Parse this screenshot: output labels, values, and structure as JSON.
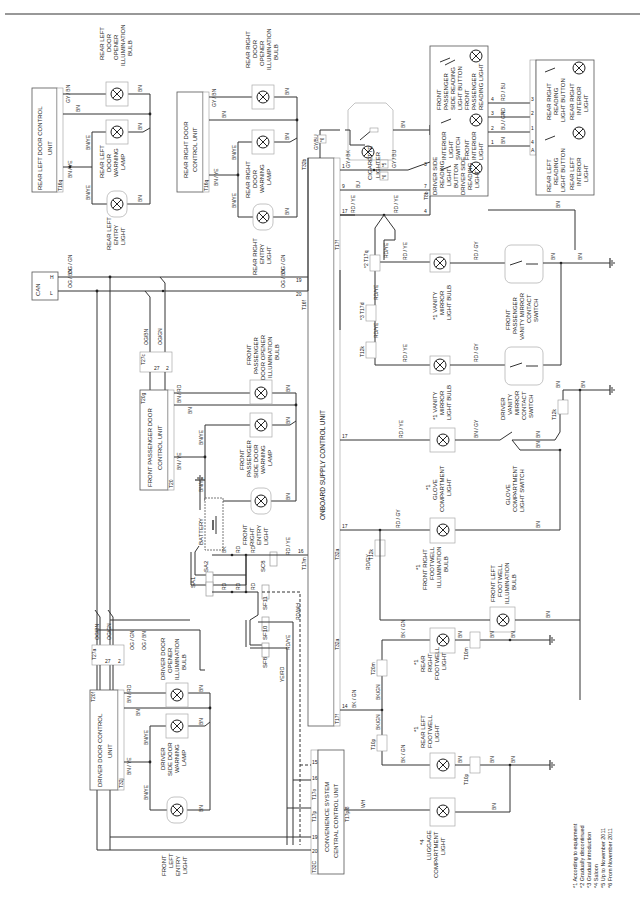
{
  "diagram": {
    "orientation": "rotated-90-ccw",
    "title_hint": "Interior lighting wiring diagram",
    "control_units": [
      {
        "id": "rear_left_door_cu",
        "label_l1": "REAR LEFT DOOR CONTROL",
        "label_l2": "UNIT",
        "connector": "T16q",
        "pins": [
          "1",
          "13",
          "12"
        ]
      },
      {
        "id": "rear_right_door_cu",
        "label_l1": "REAR RIGHT DOOR",
        "label_l2": "CONTROL UNIT",
        "connector": "T16q",
        "pins": [
          "1",
          "13",
          "12"
        ]
      },
      {
        "id": "front_passenger_door_cu",
        "label_l1": "FRONT PASSENGER DOOR",
        "label_l2": "CONTROL UNIT",
        "connector_a": "T20g",
        "connector_b": "T20",
        "pins": [
          "14",
          "15",
          "3",
          "5",
          "16"
        ]
      },
      {
        "id": "driver_door_cu",
        "label_l1": "DRIVER DOOR CONTROL",
        "label_l2": "UNIT",
        "connector_a": "T20f",
        "connector_b": "T32j",
        "pins": [
          "14",
          "15",
          "3",
          "5",
          "16"
        ]
      },
      {
        "id": "onboard_supply_cu",
        "label": "ONBOARD SUPPLY CONTROL UNIT",
        "connectors": [
          "T32b",
          "T17f",
          "T32a",
          "T17m",
          "T16f"
        ],
        "pins": [
          "17",
          "1",
          "9",
          "17",
          "17",
          "14",
          "16",
          "20",
          "19"
        ]
      },
      {
        "id": "convenience_cu",
        "label_l1": "CONVENIENCE SYSTEM",
        "label_l2": "CENTRAL CONTROL UNIT",
        "connectors": [
          "T32C",
          "T17p",
          "T17o",
          "T17p/8"
        ],
        "pins": [
          "20",
          "19",
          "16",
          "16",
          "15",
          "8"
        ]
      },
      {
        "id": "front_interior_light_unit",
        "connector": "T8b",
        "pins": [
          "3",
          "7",
          "4",
          "5",
          "1",
          "2",
          "3",
          "4"
        ]
      },
      {
        "id": "rear_interior_light_unit",
        "connector": "A",
        "pins": [
          "4",
          "1",
          "2",
          "3"
        ]
      }
    ],
    "components": {
      "rear_left_door_opener": [
        "REAR LEFT",
        "DOOR",
        "OPENER",
        "ILLUMINATION",
        "BULB"
      ],
      "rear_left_door_warning": [
        "REAR LEFT",
        "DOOR",
        "WARNING",
        "LAMP"
      ],
      "rear_left_entry": [
        "REAR LEFT",
        "ENTRY",
        "LIGHT"
      ],
      "rear_right_door_opener": [
        "REAR RIGHT",
        "DOOR",
        "OPENER",
        "ILLUMINATION",
        "BULB"
      ],
      "rear_right_door_warning": [
        "REAR RIGHT",
        "DOOR",
        "WARNING",
        "LAMP"
      ],
      "rear_right_entry": [
        "REAR RIGHT",
        "ENTRY",
        "LIGHT"
      ],
      "front_passenger_door_opener": [
        "FRONT",
        "PASSENGER",
        "DOOR OPENER",
        "ILLUMINATION",
        "BULB"
      ],
      "front_passenger_warning": [
        "FRONT",
        "PASSENGER",
        "SIDE DOOR",
        "WARNING",
        "LAMP"
      ],
      "front_right_entry": [
        "FRONT",
        "RIGHT",
        "ENTRY",
        "LIGHT"
      ],
      "driver_door_opener": [
        "DRIVER DOOR",
        "OPENER",
        "ILLUMINATION",
        "BULB"
      ],
      "driver_warning": [
        "DRIVER",
        "SIDE DOOR",
        "WARNING",
        "LAMP"
      ],
      "front_left_entry": [
        "FRONT",
        "LEFT",
        "ENTRY",
        "LIGHT"
      ],
      "cigarette_lighter": [
        "CIGARETTE",
        "LIGHTER"
      ],
      "interior_light_switch": [
        "INTERIOR",
        "LIGHT",
        "SWITCH"
      ],
      "front_interior_light": [
        "FRONT",
        "INTERIOR",
        "LIGHT"
      ],
      "fp_reading_button": [
        "FRONT",
        "PASSENGER",
        "SIDE READING",
        "LIGHT BUTTON"
      ],
      "fp_reading_light": [
        "FRONT",
        "PASSENGER",
        "READING LIGHT"
      ],
      "driver_reading_button": [
        "DRIVER SIDE",
        "READING",
        "LIGHT",
        "BUTTON"
      ],
      "driver_reading_light": [
        "DRIVER SIDE",
        "READING",
        "LIGHT"
      ],
      "rear_right_reading_button": [
        "REAR RIGHT",
        "READING",
        "LIGHT BUTTON"
      ],
      "rear_right_interior": [
        "REAR RIGHT",
        "INTERIOR",
        "LIGHT"
      ],
      "rear_left_reading_button": [
        "REAR LEFT",
        "READING",
        "LIGHT BUTTON"
      ],
      "rear_left_interior": [
        "REAR LEFT",
        "INTERIOR",
        "LIGHT"
      ],
      "vanity_right": [
        "*1 VANITY",
        "MIRROR",
        "LIGHT BULB"
      ],
      "vanity_left": [
        "*1 VANITY",
        "MIRROR",
        "LIGHT BULB"
      ],
      "fp_vanity_switch": [
        "FRONT",
        "PASSENGER",
        "VANITY MIRROR",
        "CONTACT",
        "SWITCH"
      ],
      "driver_vanity_switch": [
        "DRIVER",
        "VANITY",
        "MIRROR",
        "CONTACT",
        "SWITCH"
      ],
      "glove_light": [
        "*1",
        "GLOVE",
        "COMPARTMENT",
        "LIGHT"
      ],
      "glove_switch": [
        "GLOVE",
        "COMPARTMENT",
        "LIGHT SWITCH"
      ],
      "fr_footwell": [
        "*1",
        "FRONT RIGHT",
        "FOOTWELL",
        "ILLUMINATION",
        "BULB"
      ],
      "fl_footwell": [
        "FRONT LEFT",
        "FOOTWELL",
        "ILLUMINATION",
        "BULB"
      ],
      "rr_footwell": [
        "*1",
        "REAR",
        "RIGHT",
        "FOOTWELL",
        "LIGHT"
      ],
      "rl_footwell": [
        "*1",
        "REAR LEFT",
        "FOOTWELL",
        "LIGHT"
      ],
      "luggage": [
        "*4",
        "LUGGAGE",
        "COMPARTMENT",
        "LIGHT"
      ],
      "battery": [
        "BATTERY"
      ],
      "can": [
        "CAN"
      ]
    },
    "fuses": [
      "SA2",
      "SA1",
      "SC8",
      "SF11",
      "SF10",
      "SF8"
    ],
    "connectors_inline": [
      "T27c",
      "T27a",
      "T17q",
      "T17d",
      "T12k",
      "T20m",
      "T10p",
      "T10m",
      "T10p"
    ],
    "wire_colors": {
      "can_high": "OG / GN",
      "can_low": "OG / BN",
      "og_bn": "OG/BN",
      "og_gn": "OG/GN",
      "bn": "BN",
      "bn_ye": "BN/YE",
      "bn_ye_split": "BN / YE",
      "gy_bn": "GY / BN",
      "bn_rd": "BN / RD",
      "rd": "RD",
      "bk": "BK",
      "rd_ye": "RD / YE",
      "rd_ye_s": "RD/YE",
      "rd_gy": "RD / GY",
      "rd_gy_s": "RD/GY",
      "rd_wh": "RD/WH",
      "ye_rd": "YE/RD",
      "gy_bk": "GY / BK",
      "gy_bu": "GY / BU",
      "gy_bu_s": "GY/BU",
      "bu": "BU",
      "rd_bu": "RD / BU",
      "bu_gn": "BU / GN",
      "bk_gn": "BK / GN",
      "bk_gn_s": "BK/GN",
      "bn_gy": "BN / GY",
      "wh": "WH"
    },
    "pin_labels": {
      "p1": "1",
      "p2": "2",
      "p3": "3",
      "p4": "4",
      "p5": "5",
      "p7": "7",
      "p9": "9",
      "p12": "12",
      "p13": "13",
      "p14": "14",
      "p15": "15",
      "p16": "16",
      "p17": "17",
      "p19": "19",
      "p20": "20",
      "p27": "27",
      "p8": "8",
      "pA": "A",
      "pH": "H",
      "pL": "L"
    },
    "connector_labels": {
      "T16q": "T16q",
      "T20g": "T20g",
      "T20": "T20",
      "T20f": "T20f",
      "T32j": "T32j",
      "T32b": "T32b",
      "T17f": "T17f",
      "T32a": "T32a",
      "T17m": "T17m",
      "T16f": "T16f",
      "T32C": "T32C",
      "T17p": "T17p",
      "T17o": "T17o",
      "T17p8": "T17p/8",
      "T8b": "T8b",
      "T27c": "T27c",
      "T27a": "T27a",
      "T17q": "*2 T17q",
      "T17d": "*3 T17d",
      "T12k": "T12k",
      "T20m": "T20m",
      "T10p": "T10p",
      "T10m": "T10m",
      "T5": "T5",
      "T5b": "*5",
      "T5c": "*6"
    },
    "footnotes": [
      "*1 According to equipment",
      "*2 Gradually discontinued",
      "*3 Gradual introduction",
      "*4 Saloon",
      "*5 Up to November 2011",
      "*6 From November 2011"
    ]
  }
}
